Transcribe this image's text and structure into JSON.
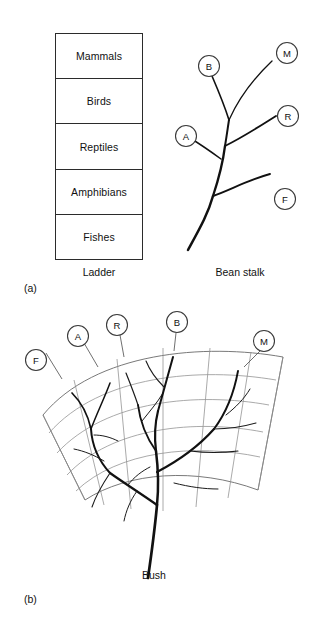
{
  "figure": {
    "panels": [
      {
        "letter": "(a)",
        "diagrams": [
          {
            "name": "ladder",
            "caption": "Ladder",
            "rungs": [
              {
                "label": "Mammals"
              },
              {
                "label": "Birds"
              },
              {
                "label": "Reptiles"
              },
              {
                "label": "Amphibians"
              },
              {
                "label": "Fishes"
              }
            ]
          },
          {
            "name": "bean-stalk",
            "caption": "Bean stalk",
            "tips": [
              {
                "code": "M",
                "meaning": "Mammals"
              },
              {
                "code": "B",
                "meaning": "Birds"
              },
              {
                "code": "R",
                "meaning": "Reptiles"
              },
              {
                "code": "A",
                "meaning": "Amphibians"
              },
              {
                "code": "F",
                "meaning": "Fishes"
              }
            ]
          }
        ]
      },
      {
        "letter": "(b)",
        "diagrams": [
          {
            "name": "bush",
            "caption": "Bush",
            "tips": [
              {
                "code": "F",
                "meaning": "Fishes"
              },
              {
                "code": "A",
                "meaning": "Amphibians"
              },
              {
                "code": "R",
                "meaning": "Reptiles"
              },
              {
                "code": "B",
                "meaning": "Birds"
              },
              {
                "code": "M",
                "meaning": "Mammals"
              }
            ]
          }
        ]
      }
    ]
  },
  "colors": {
    "ink": "#111111",
    "box_stroke": "#2b2b2b",
    "grid_stroke": "#8e8e8e",
    "node_stroke": "#3a3a3a",
    "background": "#ffffff"
  }
}
